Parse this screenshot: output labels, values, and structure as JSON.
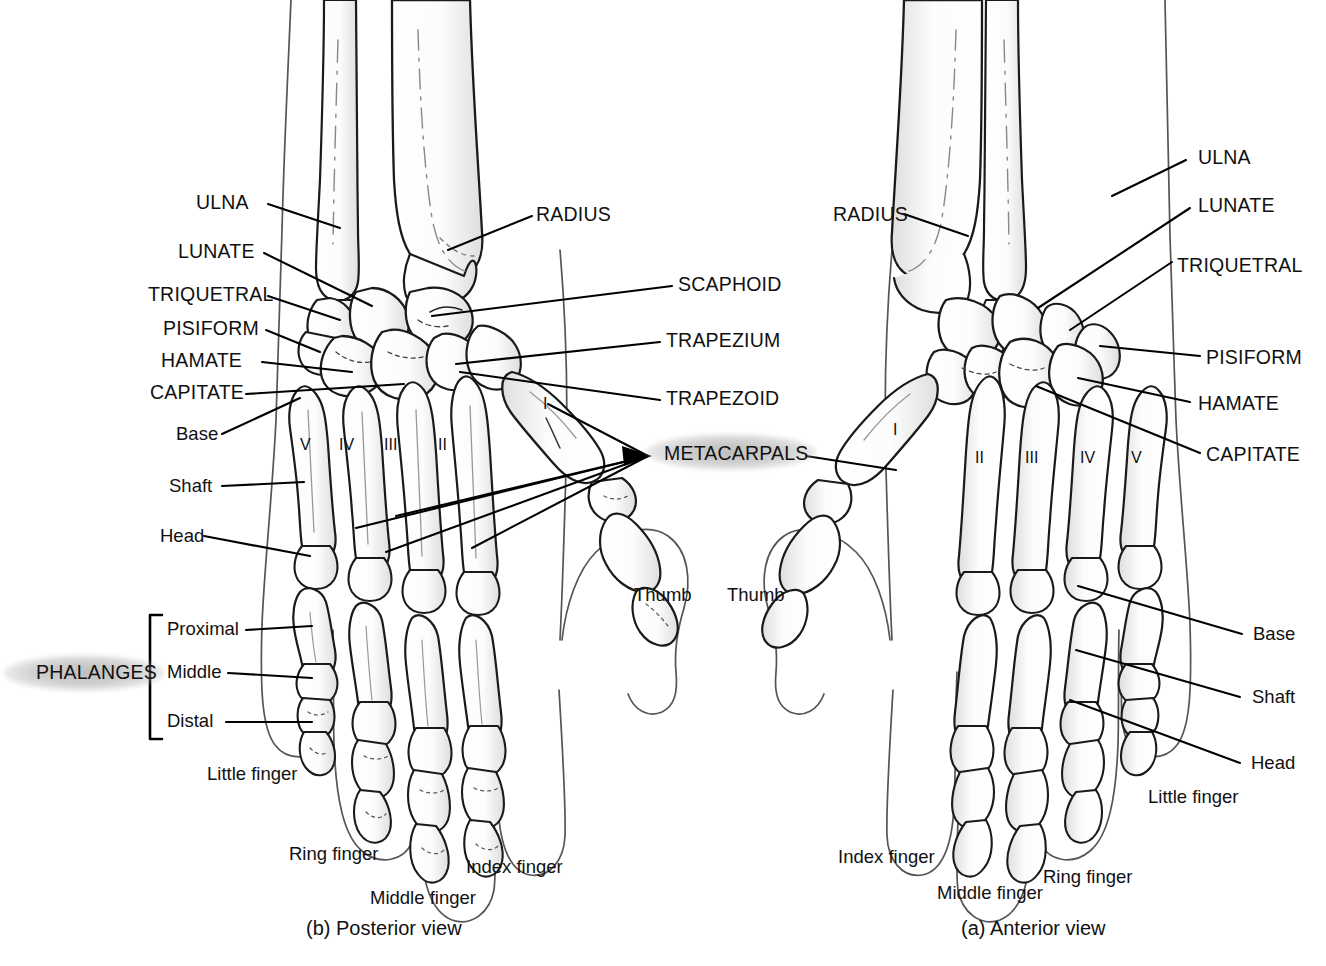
{
  "figure": {
    "captions": {
      "posterior": "(b) Posterior view",
      "anterior": "(a) Anterior view"
    },
    "highlight_color": "#b0b0b0",
    "line_color": "#000000"
  },
  "posterior": {
    "view_label": "(b) Posterior view",
    "left_labels": [
      {
        "text": "ULNA",
        "style": "caps"
      },
      {
        "text": "LUNATE",
        "style": "caps"
      },
      {
        "text": "TRIQUETRAL",
        "style": "caps"
      },
      {
        "text": "PISIFORM",
        "style": "caps"
      },
      {
        "text": "HAMATE",
        "style": "caps"
      },
      {
        "text": "CAPITATE",
        "style": "caps"
      },
      {
        "text": "Base",
        "style": "mixed"
      },
      {
        "text": "Shaft",
        "style": "mixed"
      },
      {
        "text": "Head",
        "style": "mixed"
      }
    ],
    "phalanges_group": {
      "group_label": "PHALANGES",
      "items": [
        "Proximal",
        "Middle",
        "Distal"
      ]
    },
    "metacarpal_numerals": [
      "V",
      "IV",
      "III",
      "II",
      "I"
    ],
    "thumb_label": "Thumb",
    "finger_labels": [
      "Little finger",
      "Ring finger",
      "Middle finger",
      "Index finger"
    ]
  },
  "center_labels": [
    {
      "text": "RADIUS",
      "style": "caps"
    },
    {
      "text": "SCAPHOID",
      "style": "caps"
    },
    {
      "text": "TRAPEZIUM",
      "style": "caps"
    },
    {
      "text": "TRAPEZOID",
      "style": "caps"
    },
    {
      "text": "METACARPALS",
      "style": "caps",
      "highlighted": true
    }
  ],
  "anterior": {
    "view_label": "(a) Anterior view",
    "left_label": {
      "text": "RADIUS",
      "style": "caps"
    },
    "right_labels": [
      {
        "text": "ULNA",
        "style": "caps"
      },
      {
        "text": "LUNATE",
        "style": "caps"
      },
      {
        "text": "TRIQUETRAL",
        "style": "caps"
      },
      {
        "text": "PISIFORM",
        "style": "caps"
      },
      {
        "text": "HAMATE",
        "style": "caps"
      },
      {
        "text": "CAPITATE",
        "style": "caps"
      },
      {
        "text": "Base",
        "style": "mixed"
      },
      {
        "text": "Shaft",
        "style": "mixed"
      },
      {
        "text": "Head",
        "style": "mixed"
      }
    ],
    "metacarpal_numerals": [
      "I",
      "II",
      "III",
      "IV",
      "V"
    ],
    "thumb_label": "Thumb",
    "finger_labels": [
      "Index finger",
      "Middle finger",
      "Ring finger",
      "Little finger"
    ]
  }
}
